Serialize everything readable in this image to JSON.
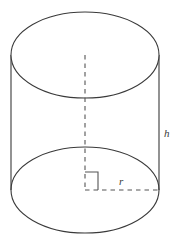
{
  "figure": {
    "name": "cylinder-solid-geometry-diagram",
    "background_color": "#ffffff",
    "stroke_color": "#3a3a3a",
    "dash_color": "#555555",
    "stroke_width": 1.1
  },
  "labels": {
    "height": "h",
    "radius": "r"
  },
  "geometry": {
    "center_x": 85,
    "semi_major_axis": 74,
    "semi_minor_axis": 43,
    "top_ellipse_center_y": 55,
    "bottom_ellipse_center_y": 190,
    "left_side_x": 11,
    "right_side_x": 159,
    "height_px": 135
  },
  "annotations": {
    "axis_line": "dashed-vertical-center-axis",
    "radius_line": "dashed-horizontal-radius",
    "right_angle": "right-angle-marker"
  }
}
